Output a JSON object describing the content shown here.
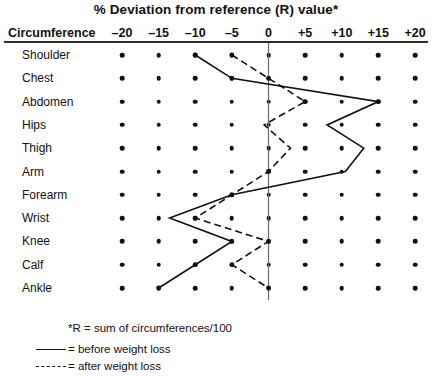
{
  "chart_data": {
    "type": "line",
    "title": "% Deviation from reference (R) value*",
    "xlabel": "% Deviation from reference (R) value",
    "ylabel": "Circumference",
    "row_header": "Circumference",
    "xlim": [
      -22.5,
      22.5
    ],
    "xticks": [
      -20,
      -15,
      -10,
      -5,
      0,
      5,
      10,
      15,
      20
    ],
    "xtick_labels": [
      "–20",
      "–15",
      "–10",
      "–5",
      "0",
      "+5",
      "+10",
      "+15",
      "+20"
    ],
    "grid": "dot-matrix",
    "zero_line": true,
    "categories": [
      "Shoulder",
      "Chest",
      "Abdomen",
      "Hips",
      "Thigh",
      "Arm",
      "Forearm",
      "Wrist",
      "Knee",
      "Calf",
      "Ankle"
    ],
    "series": [
      {
        "name": "before weight loss",
        "style": "solid",
        "values": [
          -10,
          -5,
          15,
          8,
          13,
          10.5,
          -5,
          -13.5,
          -5,
          -10,
          -15
        ]
      },
      {
        "name": "after weight loss",
        "style": "dashed",
        "values": [
          -5,
          0,
          5,
          -0.6,
          3,
          0,
          -5,
          -10,
          0,
          -5,
          0
        ]
      }
    ],
    "legend_position": "bottom-left",
    "notes": [
      "*R = sum of circumferences/100"
    ],
    "legend_entries": [
      {
        "style": "solid",
        "label": "= before weight loss"
      },
      {
        "style": "dashed",
        "label": "= after weight loss"
      }
    ]
  },
  "colors": {
    "ink": "#111111",
    "rule": "#2b2b2b",
    "zero_line": "#6b6b6b",
    "background": "#ffffff"
  }
}
